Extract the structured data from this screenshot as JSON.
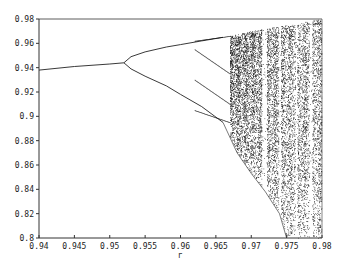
{
  "chart_data": {
    "type": "scatter",
    "title": "",
    "xlabel": "r",
    "ylabel": "",
    "xlim": [
      0.94,
      0.98
    ],
    "ylim": [
      0.8,
      0.98
    ],
    "x_ticks": [
      "0.94",
      "0.945",
      "0.95",
      "0.955",
      "0.96",
      "0.965",
      "0.97",
      "0.975",
      "0.98"
    ],
    "y_ticks": [
      "0.8",
      "0.82",
      "0.84",
      "0.86",
      "0.88",
      "0.9",
      "0.92",
      "0.94",
      "0.96",
      "0.98"
    ],
    "grid": false,
    "legend": null,
    "series": [
      {
        "name": "fixed point",
        "points": [
          [
            0.94,
            0.938
          ],
          [
            0.945,
            0.941
          ],
          [
            0.95,
            0.943
          ],
          [
            0.952,
            0.944
          ]
        ]
      },
      {
        "name": "period-2 upper",
        "points": [
          [
            0.952,
            0.944
          ],
          [
            0.953,
            0.949
          ],
          [
            0.955,
            0.953
          ],
          [
            0.958,
            0.957
          ],
          [
            0.96,
            0.959
          ],
          [
            0.963,
            0.962
          ],
          [
            0.966,
            0.965
          ]
        ]
      },
      {
        "name": "period-2 lower",
        "points": [
          [
            0.952,
            0.944
          ],
          [
            0.953,
            0.939
          ],
          [
            0.955,
            0.933
          ],
          [
            0.958,
            0.925
          ],
          [
            0.96,
            0.918
          ],
          [
            0.963,
            0.908
          ],
          [
            0.966,
            0.895
          ]
        ]
      },
      {
        "name": "chaotic lower envelope",
        "points": [
          [
            0.966,
            0.895
          ],
          [
            0.968,
            0.87
          ],
          [
            0.97,
            0.853
          ],
          [
            0.972,
            0.838
          ],
          [
            0.974,
            0.82
          ],
          [
            0.975,
            0.8
          ]
        ]
      },
      {
        "name": "chaotic upper envelope",
        "points": [
          [
            0.966,
            0.965
          ],
          [
            0.97,
            0.97
          ],
          [
            0.975,
            0.975
          ],
          [
            0.98,
            0.98
          ]
        ]
      }
    ]
  }
}
